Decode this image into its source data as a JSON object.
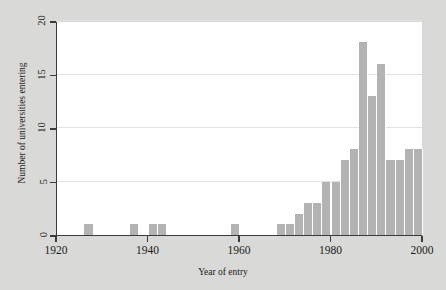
{
  "chart_data": {
    "type": "bar",
    "title": "",
    "subtitle": "",
    "xlabel": "Year of entry",
    "ylabel": "Number of universities entering",
    "xlim": [
      1920,
      2000
    ],
    "ylim": [
      0,
      20
    ],
    "xticks": [
      1920,
      1940,
      1960,
      1980,
      2000
    ],
    "xtick_labels": [
      "1920",
      "1940",
      "1960",
      "1980",
      "2000"
    ],
    "yticks": [
      0,
      5,
      10,
      15,
      20
    ],
    "ytick_labels": [
      "0",
      "5",
      "10",
      "15",
      "20"
    ],
    "grid": "horizontal",
    "legend": "none",
    "bin_width": 2,
    "bar_color": "#b3b3b3",
    "background_color": "#ffffff",
    "figure_background": "#d9d9d7",
    "axis_color": "#3a3a3a",
    "grid_color": "#e2e2e2",
    "bins": [
      {
        "start": 1926,
        "end": 1928,
        "value": 1
      },
      {
        "start": 1936,
        "end": 1938,
        "value": 1
      },
      {
        "start": 1940,
        "end": 1942,
        "value": 1
      },
      {
        "start": 1942,
        "end": 1944,
        "value": 1
      },
      {
        "start": 1958,
        "end": 1960,
        "value": 1
      },
      {
        "start": 1968,
        "end": 1970,
        "value": 1
      },
      {
        "start": 1970,
        "end": 1972,
        "value": 1
      },
      {
        "start": 1972,
        "end": 1974,
        "value": 2
      },
      {
        "start": 1974,
        "end": 1976,
        "value": 3
      },
      {
        "start": 1976,
        "end": 1978,
        "value": 3
      },
      {
        "start": 1978,
        "end": 1980,
        "value": 5
      },
      {
        "start": 1980,
        "end": 1982,
        "value": 5
      },
      {
        "start": 1982,
        "end": 1984,
        "value": 7
      },
      {
        "start": 1984,
        "end": 1986,
        "value": 8
      },
      {
        "start": 1986,
        "end": 1988,
        "value": 18
      },
      {
        "start": 1988,
        "end": 1990,
        "value": 13
      },
      {
        "start": 1990,
        "end": 1992,
        "value": 16
      },
      {
        "start": 1992,
        "end": 1994,
        "value": 7
      },
      {
        "start": 1994,
        "end": 1996,
        "value": 7
      },
      {
        "start": 1996,
        "end": 1998,
        "value": 8
      },
      {
        "start": 1998,
        "end": 2000,
        "value": 8
      }
    ]
  }
}
